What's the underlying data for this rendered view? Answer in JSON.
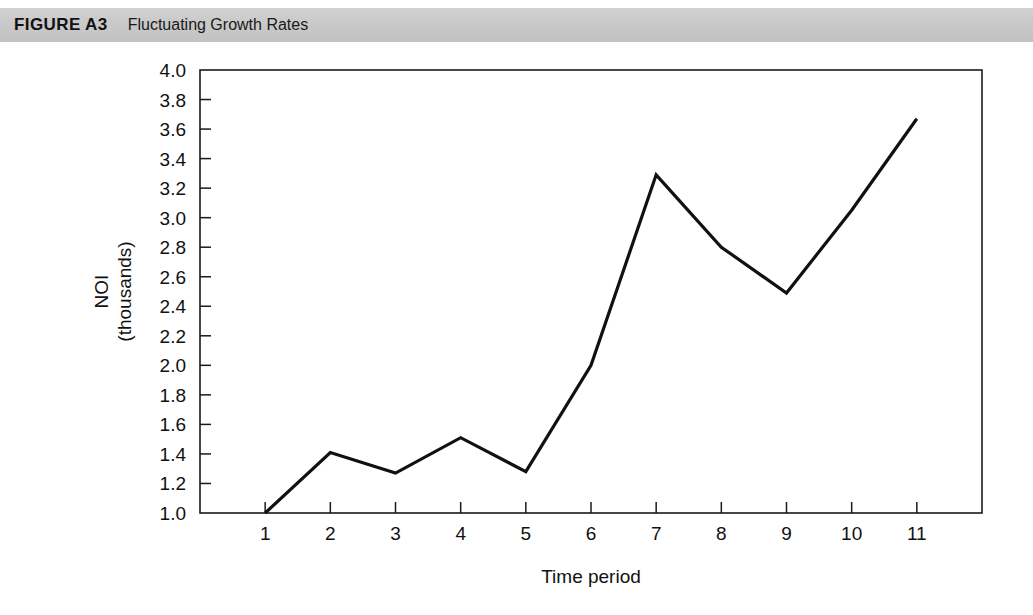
{
  "header": {
    "figure_label": "FIGURE A3",
    "figure_title": "Fluctuating Growth Rates",
    "band_color": "#c8c8c8"
  },
  "chart_data": {
    "type": "line",
    "title": "Fluctuating Growth Rates",
    "xlabel": "Time period",
    "ylabel": "NOI\n(thousands)",
    "ylabel_line1": "NOI",
    "ylabel_line2": "(thousands)",
    "x": [
      1,
      2,
      3,
      4,
      5,
      6,
      7,
      8,
      9,
      10,
      11
    ],
    "values": [
      1.0,
      1.41,
      1.27,
      1.51,
      1.28,
      2.0,
      3.29,
      2.8,
      2.49,
      3.05,
      3.67
    ],
    "series": [
      {
        "name": "NOI",
        "values": [
          1.0,
          1.41,
          1.27,
          1.51,
          1.28,
          2.0,
          3.29,
          2.8,
          2.49,
          3.05,
          3.67
        ],
        "color": "#111111"
      }
    ],
    "xlim": [
      0,
      12
    ],
    "ylim": [
      1.0,
      4.0
    ],
    "ytick_step": 0.2,
    "ytick_labels": [
      "1.0",
      "1.2",
      "1.4",
      "1.6",
      "1.8",
      "2.0",
      "2.2",
      "2.4",
      "2.6",
      "2.8",
      "3.0",
      "3.2",
      "3.4",
      "3.6",
      "3.8",
      "4.0"
    ],
    "ytick_values": [
      1.0,
      1.2,
      1.4,
      1.6,
      1.8,
      2.0,
      2.2,
      2.4,
      2.6,
      2.8,
      3.0,
      3.2,
      3.4,
      3.6,
      3.8,
      4.0
    ],
    "xtick_labels": [
      "1",
      "2",
      "3",
      "4",
      "5",
      "6",
      "7",
      "8",
      "9",
      "10",
      "11"
    ],
    "xtick_values": [
      1,
      2,
      3,
      4,
      5,
      6,
      7,
      8,
      9,
      10,
      11
    ],
    "grid": false,
    "legend": null,
    "line_color": "#111111",
    "markers": false
  }
}
